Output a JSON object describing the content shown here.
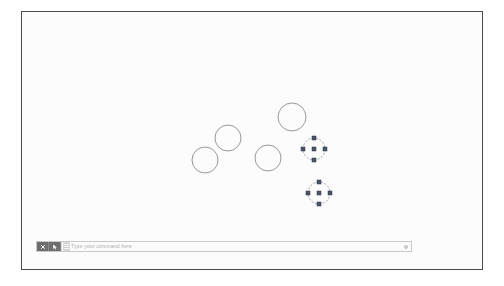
{
  "app": {
    "name": "CAD Drawing Editor",
    "canvas_background": "#fcfcfc",
    "frame_border_color": "#4a4a4a"
  },
  "canvas": {
    "entity_color": "#8d8d8d",
    "selected_outline_color": "#9aa0a6",
    "grip_color": "#4a5568",
    "grip_border_color": "#2f3748",
    "circles": [
      {
        "id": "circle-1",
        "cx": 204,
        "cy": 159,
        "r": 13,
        "selected": false
      },
      {
        "id": "circle-2",
        "cx": 227,
        "cy": 137,
        "r": 13,
        "selected": false
      },
      {
        "id": "circle-3",
        "cx": 267,
        "cy": 157,
        "r": 13,
        "selected": false
      },
      {
        "id": "circle-4",
        "cx": 291,
        "cy": 116,
        "r": 14,
        "selected": false
      },
      {
        "id": "circle-5",
        "cx": 313,
        "cy": 148,
        "r": 11,
        "selected": true
      },
      {
        "id": "circle-6",
        "cx": 318,
        "cy": 192,
        "r": 11,
        "selected": true
      }
    ],
    "selected_count": 2,
    "grip_size": 4
  },
  "command_bar": {
    "close_button": {
      "label": "X",
      "icon": "close-icon",
      "title": "Close"
    },
    "options_button": {
      "label": "",
      "icon": "cursor-arrow-icon",
      "title": "Command line options"
    },
    "prompt_icon": "command-prompt-icon",
    "input": {
      "value": "",
      "placeholder": "Type your command here"
    },
    "expand_button": {
      "icon": "chevron-expand-icon",
      "title": "Expand command history"
    }
  }
}
